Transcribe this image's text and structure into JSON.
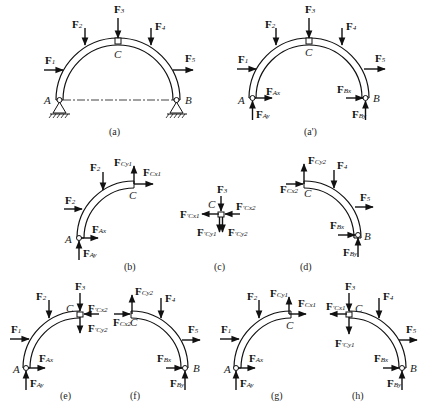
{
  "figure": {
    "panels": [
      {
        "id": "a",
        "caption": "(a)",
        "description": "Three-hinged arch with supports A and B, hinge C, loads F1–F5"
      },
      {
        "id": "a_prime",
        "caption": "(a')",
        "description": "Whole-arch free body with reactions FAx, FAy, FBx, FBy"
      },
      {
        "id": "b",
        "caption": "(b)",
        "description": "Left half AC free body with FCx1, FCy1"
      },
      {
        "id": "c",
        "caption": "(c)",
        "description": "Hinge pin C free body with F3, F'Cx1, F'Cy1, F'Cx2, F'Cy2"
      },
      {
        "id": "d",
        "caption": "(d)",
        "description": "Right half CB free body with FCx2, FCy2"
      },
      {
        "id": "e",
        "caption": "(e)",
        "description": "Left half with pin C and F3"
      },
      {
        "id": "f",
        "caption": "(f)",
        "description": "Right half without pin"
      },
      {
        "id": "g",
        "caption": "(g)",
        "description": "Left half without pin"
      },
      {
        "id": "h",
        "caption": "(h)",
        "description": "Right half with pin C and F3"
      }
    ],
    "points": {
      "A": "A",
      "B": "B",
      "C": "C"
    },
    "forces": {
      "F": "F",
      "s1": "1",
      "s2": "2",
      "s3": "3",
      "s4": "4",
      "s5": "5",
      "Ax": "Ax",
      "Ay": "Ay",
      "Bx": "Bx",
      "By": "By",
      "Cx1": "Cx1",
      "Cy1": "Cy1",
      "Cx2": "Cx2",
      "Cy2": "Cy2",
      "prime": "′"
    }
  },
  "colors": {
    "ink": "#111111",
    "background": "#ffffff"
  }
}
